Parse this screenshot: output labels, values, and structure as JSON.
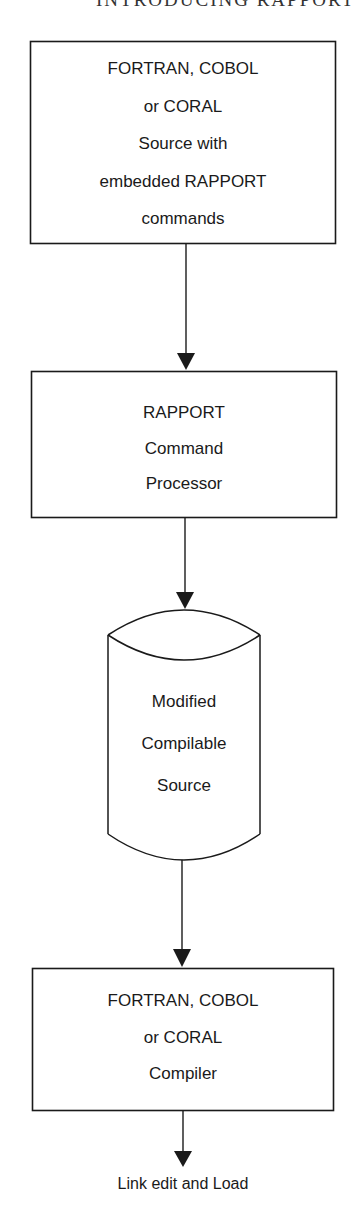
{
  "page": {
    "running_header": "INTRODUCING RAPPORT"
  },
  "flowchart": {
    "nodes": [
      {
        "id": "source",
        "shape": "rectangle",
        "lines": [
          "FORTRAN, COBOL",
          "or CORAL",
          "Source with",
          "embedded RAPPORT",
          "commands"
        ]
      },
      {
        "id": "processor",
        "shape": "rectangle",
        "lines": [
          "RAPPORT",
          "Command",
          "Processor"
        ]
      },
      {
        "id": "modified-source",
        "shape": "cylinder",
        "lines": [
          "Modified",
          "Compilable",
          "Source"
        ]
      },
      {
        "id": "compiler",
        "shape": "rectangle",
        "lines": [
          "FORTRAN, COBOL",
          "or CORAL",
          "Compiler"
        ]
      },
      {
        "id": "link-edit",
        "shape": "terminal-label",
        "lines": [
          "Link edit and Load"
        ]
      }
    ],
    "edges": [
      {
        "from": "source",
        "to": "processor",
        "arrow": "down"
      },
      {
        "from": "processor",
        "to": "modified-source",
        "arrow": "down"
      },
      {
        "from": "modified-source",
        "to": "compiler",
        "arrow": "down"
      },
      {
        "from": "compiler",
        "to": "link-edit",
        "arrow": "down"
      }
    ],
    "colors": {
      "stroke": "#1a1a1a",
      "background": "#ffffff"
    }
  }
}
